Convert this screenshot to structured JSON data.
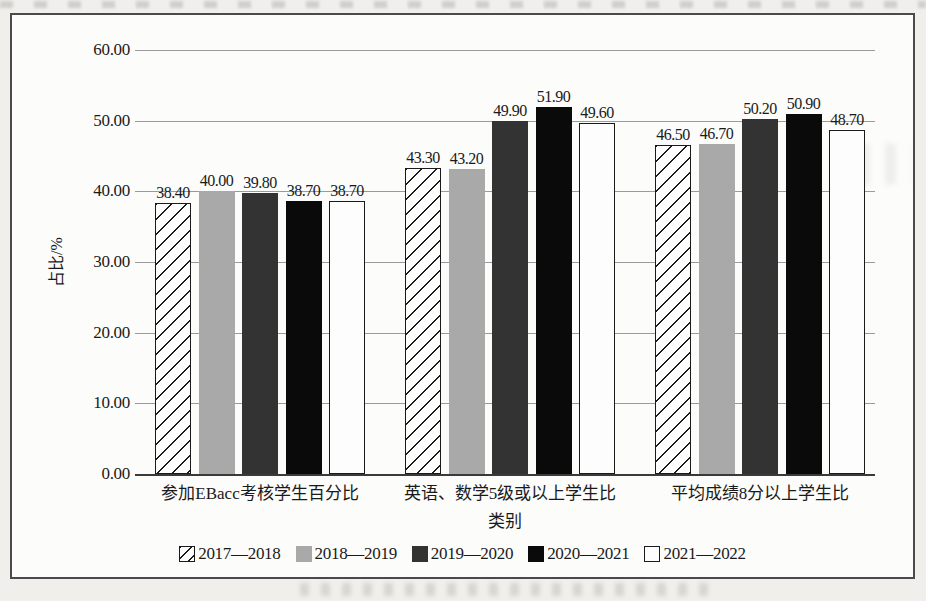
{
  "chart_data": {
    "type": "bar",
    "title": "",
    "categories": [
      "参加EBacc考核学生百分比",
      "英语、数学5级或以上学生比",
      "平均成绩8分以上学生比"
    ],
    "series": [
      {
        "name": "2017—2018",
        "values": [
          38.4,
          43.3,
          46.5
        ],
        "fill": "hatch",
        "border": "#1a1a1a"
      },
      {
        "name": "2018—2019",
        "values": [
          40.0,
          43.2,
          46.7
        ],
        "fill": "#a9a9a9"
      },
      {
        "name": "2019—2020",
        "values": [
          39.8,
          49.9,
          50.2
        ],
        "fill": "#333333"
      },
      {
        "name": "2020—2021",
        "values": [
          38.7,
          51.9,
          50.9
        ],
        "fill": "#0a0a0a"
      },
      {
        "name": "2021—2022",
        "values": [
          38.7,
          49.6,
          48.7
        ],
        "fill": "#fdfdfd",
        "border": "#1a1a1a"
      }
    ],
    "xlabel": "类别",
    "ylabel": "占比/%",
    "ylim": [
      0,
      60
    ],
    "ytick_step": 10,
    "ytick_decimals": 2,
    "value_label_decimals": 2,
    "grid": true,
    "legend_position": "bottom"
  },
  "colors": {
    "grid": "#9a9a9a",
    "axis": "#3a3a3a",
    "frame_border": "#4a4a4a",
    "page_bg": "#f0efeb",
    "chart_bg": "#fcfcfa",
    "bar_gray": "#a9a9a9",
    "bar_darkgray": "#333333",
    "bar_black": "#0a0a0a",
    "bar_white": "#fdfdfd",
    "text": "#1a1a1a"
  }
}
